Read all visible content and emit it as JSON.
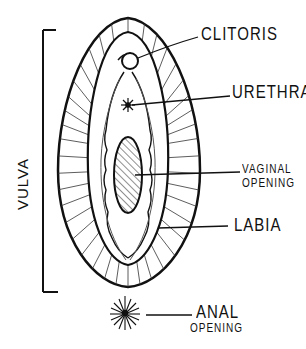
{
  "diagram": {
    "title": "",
    "bracket_label": "VULVA",
    "labels": {
      "clitoris": "CLITORIS",
      "urethra": "URETHRA",
      "vaginal_line1": "VAGINAL",
      "vaginal_line2": "OPENING",
      "labia": "LABIA",
      "anal_line1": "ANAL",
      "anal_line2": "OPENING"
    },
    "colors": {
      "ink": "#111111",
      "background": "#ffffff"
    }
  }
}
